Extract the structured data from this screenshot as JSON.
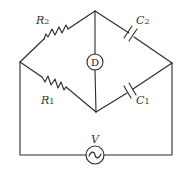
{
  "diagram": {
    "type": "AC bridge circuit",
    "components": {
      "R2": {
        "symbol": "R",
        "subscript": "2",
        "kind": "resistor",
        "branch": "left-node to top-node"
      },
      "R1": {
        "symbol": "R",
        "subscript": "1",
        "kind": "resistor",
        "branch": "left-node to bottom-node"
      },
      "C2": {
        "symbol": "C",
        "subscript": "2",
        "kind": "capacitor",
        "branch": "top-node to right-node"
      },
      "C1": {
        "symbol": "C",
        "subscript": "1",
        "kind": "capacitor",
        "branch": "bottom-node to right-node"
      },
      "D": {
        "symbol": "D",
        "kind": "detector",
        "branch": "top-node to bottom-node"
      },
      "V": {
        "symbol": "V",
        "kind": "ac-voltage-source",
        "glyph": "~",
        "branch": "left-node to right-node via bottom wire"
      }
    },
    "colors": {
      "line": "#2a2a2a",
      "text": "#333333",
      "background": "#ffffff"
    }
  }
}
